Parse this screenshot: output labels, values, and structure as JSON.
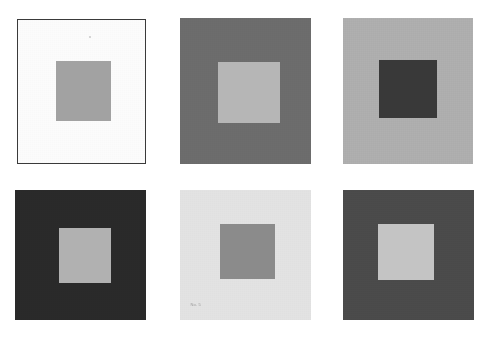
{
  "figure": {
    "background_color": "#ffffff",
    "width": 491,
    "height": 337,
    "rows": 2,
    "columns": 3,
    "panel_count": 6
  },
  "panels": [
    {
      "id": "panel-1",
      "position": "top-left",
      "row": 1,
      "column": 1,
      "outer_color": "#fcfcfc",
      "inner_color": "#a2a2a2",
      "border_color": "#3a3a3a",
      "has_border": true,
      "x": 17,
      "y": 19,
      "width": 129,
      "height": 145,
      "inner_x": 38,
      "inner_y": 41,
      "inner_width": 55,
      "inner_height": 60,
      "mark": ""
    },
    {
      "id": "panel-2",
      "position": "top-center",
      "row": 1,
      "column": 2,
      "outer_color": "#6d6d6d",
      "inner_color": "#b6b6b6",
      "border_color": "",
      "has_border": false,
      "x": 180,
      "y": 18,
      "width": 131,
      "height": 146,
      "inner_x": 38,
      "inner_y": 44,
      "inner_width": 62,
      "inner_height": 61,
      "mark": ""
    },
    {
      "id": "panel-3",
      "position": "top-right",
      "row": 1,
      "column": 3,
      "outer_color": "#b0b0b0",
      "inner_color": "#393939",
      "border_color": "",
      "has_border": false,
      "x": 343,
      "y": 18,
      "width": 130,
      "height": 146,
      "inner_x": 36,
      "inner_y": 42,
      "inner_width": 58,
      "inner_height": 58,
      "mark": ""
    },
    {
      "id": "panel-4",
      "position": "bottom-left",
      "row": 2,
      "column": 1,
      "outer_color": "#2a2a2a",
      "inner_color": "#b1b1b1",
      "border_color": "",
      "has_border": false,
      "x": 15,
      "y": 190,
      "width": 131,
      "height": 130,
      "inner_x": 44,
      "inner_y": 38,
      "inner_width": 52,
      "inner_height": 55,
      "mark": ""
    },
    {
      "id": "panel-5",
      "position": "bottom-center",
      "row": 2,
      "column": 2,
      "outer_color": "#e3e3e3",
      "inner_color": "#8b8b8b",
      "border_color": "",
      "has_border": false,
      "x": 180,
      "y": 190,
      "width": 131,
      "height": 130,
      "inner_x": 40,
      "inner_y": 34,
      "inner_width": 55,
      "inner_height": 55,
      "mark": "No. 5"
    },
    {
      "id": "panel-6",
      "position": "bottom-right",
      "row": 2,
      "column": 3,
      "outer_color": "#4b4b4b",
      "inner_color": "#c4c4c4",
      "border_color": "",
      "has_border": false,
      "x": 343,
      "y": 190,
      "width": 131,
      "height": 130,
      "inner_x": 35,
      "inner_y": 34,
      "inner_width": 56,
      "inner_height": 56,
      "mark": ""
    }
  ]
}
